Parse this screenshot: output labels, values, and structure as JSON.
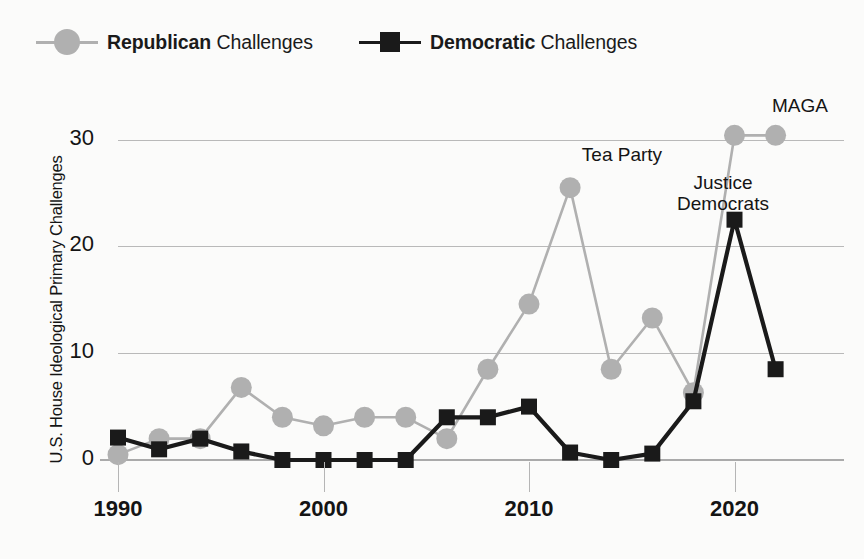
{
  "legend": {
    "entries": [
      {
        "bold": "Republican",
        "rest": " Challenges",
        "marker": "circle-marker",
        "color": "#b0b0b0"
      },
      {
        "bold": "Democratic",
        "rest": " Challenges",
        "marker": "square-marker",
        "color": "#1a1a1a"
      }
    ]
  },
  "axes": {
    "ylabel": "U.S. House Ideological Primary Challenges",
    "yticks": [
      "0",
      "10",
      "20",
      "30"
    ],
    "xticks": [
      "1990",
      "2000",
      "2010",
      "2020"
    ]
  },
  "annotations": [
    {
      "text": "Tea Party",
      "x": 622,
      "y": 144
    },
    {
      "text": "Justice\nDemocrats",
      "x": 723,
      "y": 172
    },
    {
      "text": "MAGA",
      "x": 800,
      "y": 95
    }
  ],
  "chart_data": {
    "type": "line",
    "title": "",
    "xlabel": "",
    "ylabel": "U.S. House Ideological Primary Challenges",
    "xlim": [
      1989,
      2023
    ],
    "ylim": [
      0,
      33
    ],
    "yticks": [
      0,
      10,
      20,
      30
    ],
    "xticks": [
      1990,
      2000,
      2010,
      2020
    ],
    "grid": "horizontal",
    "legend_position": "top-left",
    "x": [
      1990,
      1992,
      1994,
      1996,
      1998,
      2000,
      2002,
      2004,
      2006,
      2008,
      2010,
      2012,
      2014,
      2016,
      2018,
      2020,
      2022
    ],
    "series": [
      {
        "name": "Republican Challenges",
        "color": "#b0b0b0",
        "marker": "circle",
        "values": [
          0.5,
          2.0,
          2.0,
          6.8,
          4.0,
          3.2,
          4.0,
          4.0,
          2.0,
          8.5,
          14.6,
          25.5,
          8.5,
          13.3,
          6.3,
          30.4,
          30.4
        ]
      },
      {
        "name": "Democratic Challenges",
        "color": "#1a1a1a",
        "marker": "square",
        "values": [
          2.1,
          1.0,
          2.0,
          0.8,
          0.0,
          0.0,
          0.0,
          0.0,
          4.0,
          4.0,
          5.0,
          0.7,
          0.0,
          0.6,
          5.5,
          22.5,
          8.5
        ]
      }
    ],
    "notes": [
      "Republican series: 1990=0.5, 1992=2.0, 1994=2.0, 1996=6.8, 1998=4.0, 2000=3.2, 2002=4.0, 2004=4.0, 2006=2.0, 2008=8.5, 2010=14.6, 2012=25.5, 2014=8.5, 2016=13.3, 2018=6.3, 2020=30.4",
      "Democratic series: 1990=2.1, 1992=1.0, 1994=2.0, 1996=0.8, 1998-2004=0.0, 2006=4.0, 2008=4.0, 2010=5.0, 2012=0.7, 2014=0.0, 2016=0.6, 2018=5.5, 2020=22.5, 2022=8.5"
    ],
    "annotations": [
      "Tea Party",
      "Justice Democrats",
      "MAGA"
    ]
  },
  "geometry": {
    "x0_px": 118.0,
    "x_per_year_px": 20.55,
    "x_base_year": 1990,
    "y0_px": 460.0,
    "y_per_unit_px": 10.68
  }
}
